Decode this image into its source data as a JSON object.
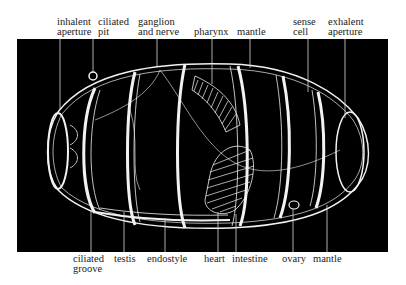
{
  "figure": {
    "panel_color": "#000000",
    "line_color": "#f2f2f2",
    "top_labels": [
      {
        "id": "inhalent-aperture",
        "line1": "inhalent",
        "line2": "aperture",
        "x": 57,
        "lead_x": 60
      },
      {
        "id": "ciliated-pit",
        "line1": "ciliated",
        "line2": "pit",
        "x": 98,
        "lead_x": 93
      },
      {
        "id": "ganglion-and-nerve",
        "line1": "ganglion",
        "line2": "and nerve",
        "x": 138,
        "lead_x": 157
      },
      {
        "id": "pharynx",
        "line1": "",
        "line2": "pharynx",
        "x": 194,
        "lead_x": 212
      },
      {
        "id": "mantle-top",
        "line1": "",
        "line2": "mantle",
        "x": 237,
        "lead_x": 250
      },
      {
        "id": "sense-cell",
        "line1": "sense",
        "line2": "cell",
        "x": 293,
        "lead_x": 308
      },
      {
        "id": "exhalent-aperture",
        "line1": "exhalent",
        "line2": "aperture",
        "x": 328,
        "lead_x": 345
      }
    ],
    "bottom_labels": [
      {
        "id": "ciliated-groove",
        "line1": "ciliated",
        "line2": "groove",
        "x": 73,
        "lead_x": 91
      },
      {
        "id": "testis",
        "line1": "testis",
        "line2": "",
        "x": 114,
        "lead_x": 124
      },
      {
        "id": "endostyle",
        "line1": "endostyle",
        "line2": "",
        "x": 147,
        "lead_x": 165
      },
      {
        "id": "heart",
        "line1": "heart",
        "line2": "",
        "x": 204,
        "lead_x": 218
      },
      {
        "id": "intestine",
        "line1": "intestine",
        "line2": "",
        "x": 232,
        "lead_x": 236
      },
      {
        "id": "ovary",
        "line1": "ovary",
        "line2": "",
        "x": 282,
        "lead_x": 293
      },
      {
        "id": "mantle-bottom",
        "line1": "mantle",
        "line2": "",
        "x": 313,
        "lead_x": 327
      }
    ]
  }
}
